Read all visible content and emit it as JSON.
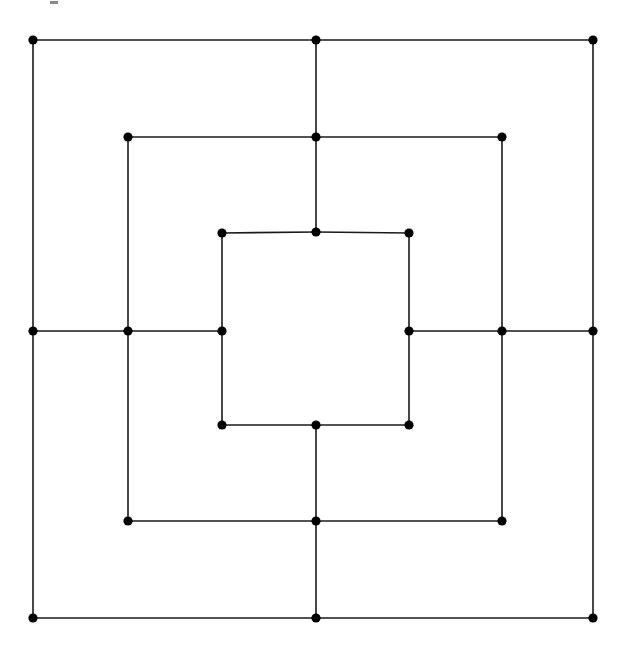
{
  "figure": {
    "caption": "",
    "background_color": "#ffffff",
    "line_color": "#1a1a1a",
    "vertex_color": "#000000",
    "line_width": 1.6,
    "vertex_radius": 4.6,
    "width": 629,
    "height": 657
  },
  "chart_data": {
    "type": "diagram",
    "xlabel": "",
    "ylabel": "",
    "grid": false,
    "legend": null,
    "vertex_count": 24,
    "edge_count": 32,
    "rings": [
      {
        "name": "outer",
        "left": 33,
        "right": 593,
        "top": 40,
        "bottom": 618,
        "mid_x": 316,
        "mid_y": 331
      },
      {
        "name": "middle",
        "left": 128,
        "right": 502,
        "top": 137,
        "bottom": 521,
        "mid_x": 316,
        "mid_y": 331
      },
      {
        "name": "inner",
        "left": 222,
        "right": 409,
        "top": 233,
        "bottom": 425,
        "mid_x": 316,
        "mid_y": 329
      }
    ],
    "vertices": [
      {
        "id": "o-tl",
        "ring": "outer",
        "pos": "top-left",
        "x": 33,
        "y": 40
      },
      {
        "id": "o-tm",
        "ring": "outer",
        "pos": "top-mid",
        "x": 316,
        "y": 40
      },
      {
        "id": "o-tr",
        "ring": "outer",
        "pos": "top-right",
        "x": 593,
        "y": 40
      },
      {
        "id": "o-ml",
        "ring": "outer",
        "pos": "mid-left",
        "x": 33,
        "y": 331
      },
      {
        "id": "o-mr",
        "ring": "outer",
        "pos": "mid-right",
        "x": 593,
        "y": 331
      },
      {
        "id": "o-bl",
        "ring": "outer",
        "pos": "bottom-left",
        "x": 33,
        "y": 618
      },
      {
        "id": "o-bm",
        "ring": "outer",
        "pos": "bottom-mid",
        "x": 316,
        "y": 618
      },
      {
        "id": "o-br",
        "ring": "outer",
        "pos": "bottom-right",
        "x": 593,
        "y": 618
      },
      {
        "id": "m-tl",
        "ring": "middle",
        "pos": "top-left",
        "x": 128,
        "y": 137
      },
      {
        "id": "m-tm",
        "ring": "middle",
        "pos": "top-mid",
        "x": 316,
        "y": 137
      },
      {
        "id": "m-tr",
        "ring": "middle",
        "pos": "top-right",
        "x": 502,
        "y": 137
      },
      {
        "id": "m-ml",
        "ring": "middle",
        "pos": "mid-left",
        "x": 128,
        "y": 331
      },
      {
        "id": "m-mr",
        "ring": "middle",
        "pos": "mid-right",
        "x": 502,
        "y": 331
      },
      {
        "id": "m-bl",
        "ring": "middle",
        "pos": "bottom-left",
        "x": 128,
        "y": 521
      },
      {
        "id": "m-bm",
        "ring": "middle",
        "pos": "bottom-mid",
        "x": 316,
        "y": 521
      },
      {
        "id": "m-br",
        "ring": "middle",
        "pos": "bottom-right",
        "x": 502,
        "y": 521
      },
      {
        "id": "i-tl",
        "ring": "inner",
        "pos": "top-left",
        "x": 222,
        "y": 233
      },
      {
        "id": "i-tm",
        "ring": "inner",
        "pos": "top-mid",
        "x": 316,
        "y": 232
      },
      {
        "id": "i-tr",
        "ring": "inner",
        "pos": "top-right",
        "x": 409,
        "y": 233
      },
      {
        "id": "i-ml",
        "ring": "inner",
        "pos": "mid-left",
        "x": 222,
        "y": 331
      },
      {
        "id": "i-mr",
        "ring": "inner",
        "pos": "mid-right",
        "x": 409,
        "y": 331
      },
      {
        "id": "i-bl",
        "ring": "inner",
        "pos": "bottom-left",
        "x": 222,
        "y": 425
      },
      {
        "id": "i-bm",
        "ring": "inner",
        "pos": "bottom-mid",
        "x": 316,
        "y": 425
      },
      {
        "id": "i-br",
        "ring": "inner",
        "pos": "bottom-right",
        "x": 409,
        "y": 425
      }
    ],
    "edges": [
      [
        "o-tl",
        "o-tm"
      ],
      [
        "o-tm",
        "o-tr"
      ],
      [
        "o-tr",
        "o-mr"
      ],
      [
        "o-mr",
        "o-br"
      ],
      [
        "o-br",
        "o-bm"
      ],
      [
        "o-bm",
        "o-bl"
      ],
      [
        "o-bl",
        "o-ml"
      ],
      [
        "o-ml",
        "o-tl"
      ],
      [
        "m-tl",
        "m-tm"
      ],
      [
        "m-tm",
        "m-tr"
      ],
      [
        "m-tr",
        "m-mr"
      ],
      [
        "m-mr",
        "m-br"
      ],
      [
        "m-br",
        "m-bm"
      ],
      [
        "m-bm",
        "m-bl"
      ],
      [
        "m-bl",
        "m-ml"
      ],
      [
        "m-ml",
        "m-tl"
      ],
      [
        "i-tl",
        "i-tm"
      ],
      [
        "i-tm",
        "i-tr"
      ],
      [
        "i-tr",
        "i-mr"
      ],
      [
        "i-mr",
        "i-br"
      ],
      [
        "i-br",
        "i-bm"
      ],
      [
        "i-bm",
        "i-bl"
      ],
      [
        "i-bl",
        "i-ml"
      ],
      [
        "i-ml",
        "i-tl"
      ],
      [
        "o-tm",
        "m-tm"
      ],
      [
        "m-tm",
        "i-tm"
      ],
      [
        "o-bm",
        "m-bm"
      ],
      [
        "m-bm",
        "i-bm"
      ],
      [
        "o-ml",
        "m-ml"
      ],
      [
        "m-ml",
        "i-ml"
      ],
      [
        "o-mr",
        "m-mr"
      ],
      [
        "m-mr",
        "i-mr"
      ]
    ],
    "artifacts": [
      {
        "id": "top-edge-mark",
        "x": 50,
        "y": 1,
        "width": 8,
        "height": 3
      }
    ]
  }
}
